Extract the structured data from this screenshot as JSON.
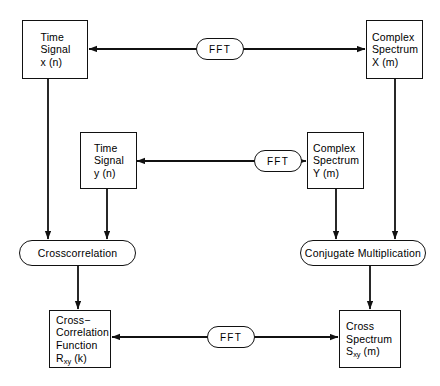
{
  "diagram": {
    "stroke_color": "#111111",
    "background_color": "#ffffff",
    "nodes": {
      "time_signal_x": {
        "label": "Time\nSignal\nx (n)",
        "shape": "rectangle"
      },
      "complex_spectrum_x": {
        "label": "Complex\nSpectrum\nX (m)",
        "shape": "rectangle"
      },
      "time_signal_y": {
        "label": "Time\nSignal\ny (n)",
        "shape": "rectangle"
      },
      "complex_spectrum_y": {
        "label": "Complex\nSpectrum\nY (m)",
        "shape": "rectangle"
      },
      "crosscorrelation": {
        "label": "Crosscorrelation",
        "shape": "oval"
      },
      "conjugate_multiplication": {
        "label": "Conjugate Multiplication",
        "shape": "oval"
      },
      "cross_correlation_function": {
        "line1": "Cross−",
        "line2": "Correlation",
        "line3": "Function",
        "line4_base": "R",
        "line4_sub": "xy",
        "line4_tail": " (k)",
        "shape": "rectangle"
      },
      "cross_spectrum": {
        "line1": "Cross",
        "line2": "Spectrum",
        "line3_base": "S",
        "line3_sub": "xy",
        "line3_tail": " (m)",
        "shape": "rectangle"
      }
    },
    "operators": {
      "fft_top": {
        "label": "FFT"
      },
      "fft_middle": {
        "label": "FFT"
      },
      "fft_bottom": {
        "label": "FFT"
      }
    }
  }
}
